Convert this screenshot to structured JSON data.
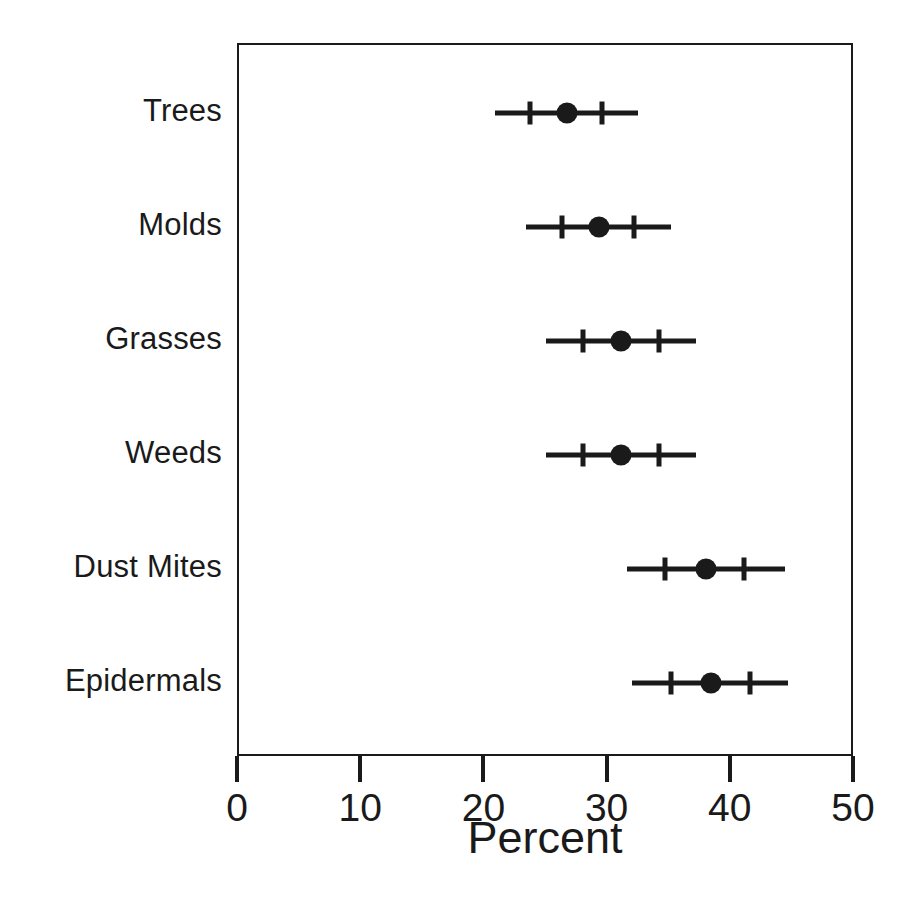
{
  "chart_data": {
    "type": "scatter",
    "title": "",
    "xlabel": "Percent",
    "ylabel": "",
    "xlim": [
      0,
      50
    ],
    "xticks": [
      0,
      10,
      20,
      30,
      40,
      50
    ],
    "xtick_labels": [
      "0",
      "10",
      "20",
      "30",
      "40",
      "50"
    ],
    "grid": false,
    "legend": "none",
    "orientation": "horizontal",
    "marker": "filled-circle",
    "error_bar_style": "outer-whisker-with-inner-ticks",
    "categories": [
      "Trees",
      "Molds",
      "Grasses",
      "Weeds",
      "Dust Mites",
      "Epidermals"
    ],
    "points": [
      {
        "category": "Trees",
        "value": 26.6,
        "outer_low": 20.8,
        "inner_low": 23.6,
        "inner_high": 29.5,
        "outer_high": 32.4
      },
      {
        "category": "Molds",
        "value": 29.2,
        "outer_low": 23.3,
        "inner_low": 26.2,
        "inner_high": 32.1,
        "outer_high": 35.1
      },
      {
        "category": "Grasses",
        "value": 31.0,
        "outer_low": 24.9,
        "inner_low": 27.9,
        "inner_high": 34.1,
        "outer_high": 37.1
      },
      {
        "category": "Weeds",
        "value": 31.0,
        "outer_low": 24.9,
        "inner_low": 27.9,
        "inner_high": 34.1,
        "outer_high": 37.1
      },
      {
        "category": "Dust Mites",
        "value": 37.9,
        "outer_low": 31.5,
        "inner_low": 34.6,
        "inner_high": 41.0,
        "outer_high": 44.3
      },
      {
        "category": "Epidermals",
        "value": 38.3,
        "outer_low": 31.9,
        "inner_low": 35.1,
        "inner_high": 41.5,
        "outer_high": 44.6
      }
    ],
    "colors": {
      "marker": "#1a1a1a",
      "line": "#1a1a1a",
      "axis": "#1a1a1a",
      "background": "#ffffff"
    }
  }
}
